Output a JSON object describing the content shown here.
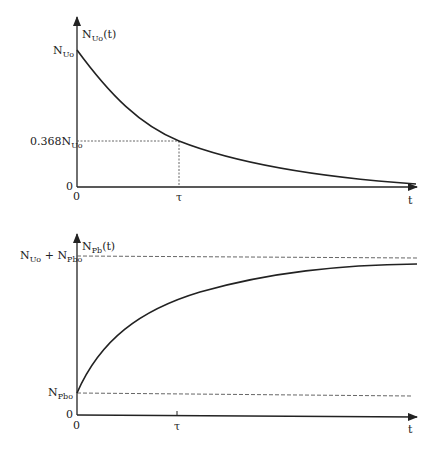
{
  "colors": {
    "line": "#222222",
    "dashed": "#555555",
    "background": "#ffffff"
  },
  "top_chart": {
    "y_axis_label": {
      "main": "N",
      "sub": "Uo",
      "tail": "(t)"
    },
    "y_ticks": [
      {
        "main": "N",
        "sub": "Uo",
        "prefix": ""
      },
      {
        "main": "N",
        "sub": "Uo",
        "prefix": "0.368"
      },
      {
        "main": "0",
        "sub": "",
        "prefix": ""
      }
    ],
    "x_ticks": [
      "0",
      "τ"
    ],
    "x_axis_label": "t",
    "curve": "exponential decay",
    "guide": "dotted lines at t = τ and N = 0.368 N_Uo"
  },
  "bottom_chart": {
    "y_axis_label": {
      "main": "N",
      "sub": "Pb",
      "tail": "(t)"
    },
    "y_ticks": [
      {
        "a_main": "N",
        "a_sub": "Uo",
        "op": " + ",
        "b_main": "N",
        "b_sub": "Pbo"
      },
      {
        "main": "N",
        "sub": "Pbo"
      },
      {
        "main": "0"
      }
    ],
    "x_ticks": [
      "0",
      "τ"
    ],
    "x_axis_label": "t",
    "curve": "exponential growth toward asymptote N_Uo + N_Pbo",
    "guide": "dashed asymptotes at N_Pbo and N_Uo + N_Pbo"
  }
}
